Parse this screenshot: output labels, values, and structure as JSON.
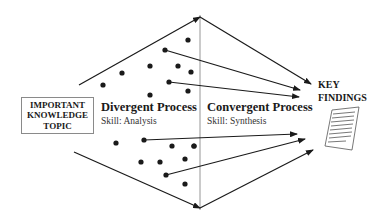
{
  "diagram": {
    "topic_box": {
      "lines": [
        "IMPORTANT",
        "KNOWLEDGE",
        "TOPIC"
      ]
    },
    "divergent": {
      "title": "Divergent Process",
      "skill": "Skill: Analysis"
    },
    "convergent": {
      "title": "Convergent Process",
      "skill": "Skill: Synthesis"
    },
    "findings": {
      "lines": [
        "KEY",
        "FINDINGS"
      ],
      "icon": "document-icon"
    },
    "colors": {
      "line": "#1a1a1a",
      "divider": "#8a8a8a",
      "box_border": "#8a8a8a"
    }
  }
}
